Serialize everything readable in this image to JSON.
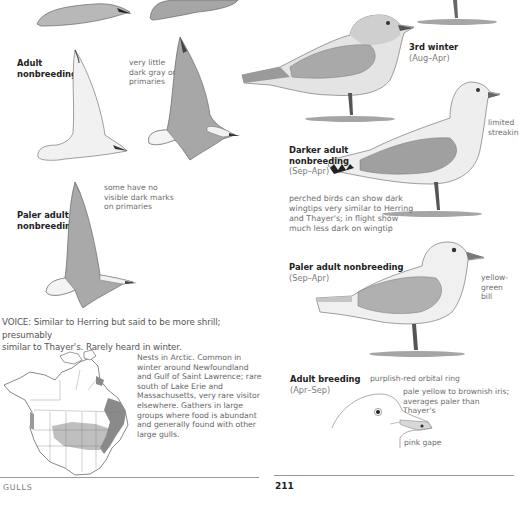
{
  "page": {
    "section_footer": "GULLS",
    "page_number": "211"
  },
  "left_page": {
    "plates": [
      {
        "id": "adult-nonbreeding-flight",
        "label": "Adult\nnonbreeding",
        "label_line1": "Adult",
        "label_line2": "nonbreeding",
        "note_lines": [
          "very little",
          "dark gray on",
          "primaries"
        ]
      },
      {
        "id": "paler-adult-nonbreeding-flight",
        "label_line1": "Paler adult",
        "label_line2": "nonbreeding",
        "note_lines": [
          "some have no",
          "visible dark marks",
          "on primaries"
        ]
      }
    ],
    "voice": {
      "line1": "VOICE: Similar to Herring but said to be more shrill; presumably",
      "line2": "similar to Thayer's. Rarely heard in winter."
    },
    "range_text": {
      "lines": [
        "Nests in Arctic. Common in",
        "winter around Newfoundland",
        "and Gulf of Saint Lawrence; rare",
        "south of Lake Erie and",
        "Massachusetts, very rare visitor",
        "elsewhere. Gathers in large",
        "groups where food is abundant",
        "and generally found with other",
        "large gulls."
      ]
    },
    "map": {
      "name": "North America range map",
      "breeding_color": "#8a8a8a",
      "winter_color": "#b8b8b8"
    }
  },
  "right_page": {
    "plates": [
      {
        "id": "third-winter",
        "label": "3rd winter",
        "season": "(Aug–Apr)"
      },
      {
        "id": "darker-adult-nonbreeding",
        "label_line1": "Darker adult",
        "label_line2": "nonbreeding",
        "season": "(Sep–Apr)",
        "side_note_lines": [
          "limited",
          "streakin"
        ],
        "note_lines": [
          "perched birds can show dark",
          "wingtips very similar to Herring",
          "and Thayer's; in flight show",
          "much less dark on wingtip"
        ]
      },
      {
        "id": "paler-adult-nonbreeding",
        "label": "Paler adult nonbreeding",
        "season": "(Sep–Apr)",
        "side_note_lines": [
          "yellow-",
          "green bill"
        ]
      },
      {
        "id": "adult-breeding",
        "label": "Adult breeding",
        "season": "(Apr–Sep)",
        "notes": {
          "orbital": "purplish-red orbital ring",
          "iris_line1": "pale yellow to brownish iris;",
          "iris_line2": "averages paler than Thayer's",
          "gape": "pink gape"
        }
      }
    ]
  },
  "colors": {
    "ink": "#222222",
    "text_gray": "#6e6e6e",
    "mantle_gray": "#a9a9a9",
    "rule": "#9a9a9a"
  }
}
